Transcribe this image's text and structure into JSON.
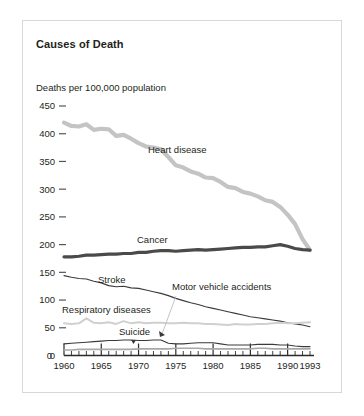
{
  "figure": {
    "title": "Causes of Death",
    "frame_color": "#d8d8d8",
    "background": "#ffffff"
  },
  "chart_data": {
    "type": "line",
    "title": "Causes of Death",
    "xlabel": "",
    "ylabel": "Deaths per 100,000 population",
    "xlim": [
      1960,
      1993
    ],
    "ylim": [
      0,
      450
    ],
    "grid": false,
    "legend": "inline-labels",
    "xticks": [
      1960,
      1965,
      1970,
      1975,
      1980,
      1985,
      1990,
      1993
    ],
    "xtick_labels": [
      "1960",
      "1965",
      "1970",
      "1975",
      "1980",
      "1985",
      "1990",
      "1993"
    ],
    "minor_xtick_interval": 1,
    "yticks": [
      0,
      50,
      100,
      150,
      200,
      250,
      300,
      350,
      400,
      450
    ],
    "ytick_labels": [
      "0",
      "50",
      "100",
      "150",
      "200",
      "250",
      "300",
      "350",
      "400",
      "450"
    ],
    "x": [
      1960,
      1961,
      1962,
      1963,
      1964,
      1965,
      1966,
      1967,
      1968,
      1969,
      1970,
      1971,
      1972,
      1973,
      1974,
      1975,
      1976,
      1977,
      1978,
      1979,
      1980,
      1981,
      1982,
      1983,
      1984,
      1985,
      1986,
      1987,
      1988,
      1989,
      1990,
      1991,
      1992,
      1993
    ],
    "series": [
      {
        "name": "Heart disease",
        "label": "Heart disease",
        "color": "#c4c4c4",
        "width": 4.2,
        "values": [
          420,
          414,
          413,
          417,
          407,
          409,
          408,
          396,
          398,
          391,
          383,
          377,
          375,
          372,
          358,
          343,
          339,
          332,
          328,
          321,
          320,
          313,
          304,
          302,
          295,
          292,
          287,
          280,
          277,
          268,
          254,
          237,
          210,
          190
        ]
      },
      {
        "name": "Cancer",
        "label": "Cancer",
        "color": "#4a4a4a",
        "width": 3.2,
        "values": [
          178,
          178,
          179,
          181,
          181,
          182,
          183,
          183,
          184,
          184,
          186,
          186,
          188,
          189,
          189,
          188,
          189,
          190,
          191,
          190,
          191,
          192,
          193,
          194,
          195,
          195,
          196,
          196,
          198,
          200,
          197,
          193,
          191,
          190
        ]
      },
      {
        "name": "Stroke",
        "label": "Stroke",
        "color": "#3a3a3a",
        "width": 1.1,
        "values": [
          144,
          141,
          139,
          138,
          134,
          131,
          126,
          124,
          125,
          122,
          121,
          118,
          115,
          112,
          108,
          103,
          99,
          95,
          92,
          88,
          85,
          82,
          79,
          76,
          73,
          70,
          68,
          66,
          64,
          62,
          59,
          57,
          55,
          52
        ]
      },
      {
        "name": "Respiratory diseases",
        "label": "Respiratory diseases",
        "color": "#d0d0d0",
        "width": 2.0,
        "values": [
          58,
          57,
          58,
          67,
          59,
          58,
          60,
          57,
          62,
          58,
          60,
          58,
          59,
          59,
          58,
          58,
          59,
          58,
          58,
          57,
          57,
          56,
          55,
          57,
          56,
          56,
          57,
          57,
          58,
          59,
          58,
          58,
          59,
          60
        ]
      },
      {
        "name": "Motor vehicle accidents",
        "label": "Motor vehicle accidents",
        "color": "#3a3a3a",
        "width": 1.1,
        "values": [
          21,
          22,
          23,
          24,
          25,
          26,
          27,
          27,
          28,
          28,
          27,
          27,
          28,
          28,
          22,
          21,
          21,
          22,
          23,
          23,
          23,
          21,
          19,
          19,
          19,
          19,
          20,
          20,
          20,
          19,
          19,
          17,
          16,
          16
        ]
      },
      {
        "name": "Suicide",
        "label": "Suicide",
        "color": "#a8a8a8",
        "width": 1.6,
        "values": [
          10,
          10,
          11,
          11,
          11,
          11,
          11,
          11,
          11,
          11,
          12,
          12,
          12,
          12,
          12,
          13,
          13,
          13,
          13,
          12,
          12,
          12,
          12,
          12,
          12,
          12,
          13,
          13,
          12,
          12,
          12,
          12,
          12,
          12
        ]
      }
    ],
    "annotations": [
      {
        "name": "heart-disease-label",
        "text": "Heart disease",
        "x": 148,
        "y": 153
      },
      {
        "name": "cancer-label",
        "text": "Cancer",
        "x": 137,
        "y": 243
      },
      {
        "name": "stroke-label",
        "text": "Stroke",
        "x": 98,
        "y": 283
      },
      {
        "name": "motor-vehicle-accidents-label",
        "text": "Motor vehicle accidents",
        "x": 172,
        "y": 290
      },
      {
        "name": "respiratory-diseases-label",
        "text": "Respiratory diseases",
        "x": 62,
        "y": 313
      },
      {
        "name": "suicide-label",
        "text": "Suicide",
        "x": 119,
        "y": 335
      }
    ]
  }
}
